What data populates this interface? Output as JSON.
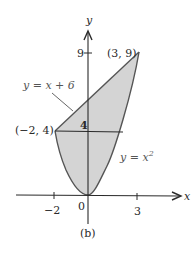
{
  "figure": {
    "caption": "(b)",
    "axes": {
      "x_label": "x",
      "y_label": "y",
      "x_ticks": [
        {
          "value": -2,
          "label": "−2"
        },
        {
          "value": 0,
          "label": "0"
        },
        {
          "value": 3,
          "label": "3"
        }
      ],
      "y_ticks": [
        {
          "value": 4,
          "label": "4"
        },
        {
          "value": 9,
          "label": "9"
        }
      ]
    },
    "curves": {
      "line": {
        "label_prefix": "y = x + 6",
        "equation": "y = x + 6"
      },
      "parabola": {
        "label_base": "y = x",
        "label_exp": "2",
        "equation": "y = x^2"
      }
    },
    "points": {
      "p1": {
        "label": "(−2, 4)",
        "x": -2,
        "y": 4
      },
      "p2": {
        "label": "(3, 9)",
        "x": 3,
        "y": 9
      }
    },
    "colors": {
      "fill": "#d4d4d4",
      "stroke": "#555555",
      "axis": "#2a2a2a"
    }
  }
}
